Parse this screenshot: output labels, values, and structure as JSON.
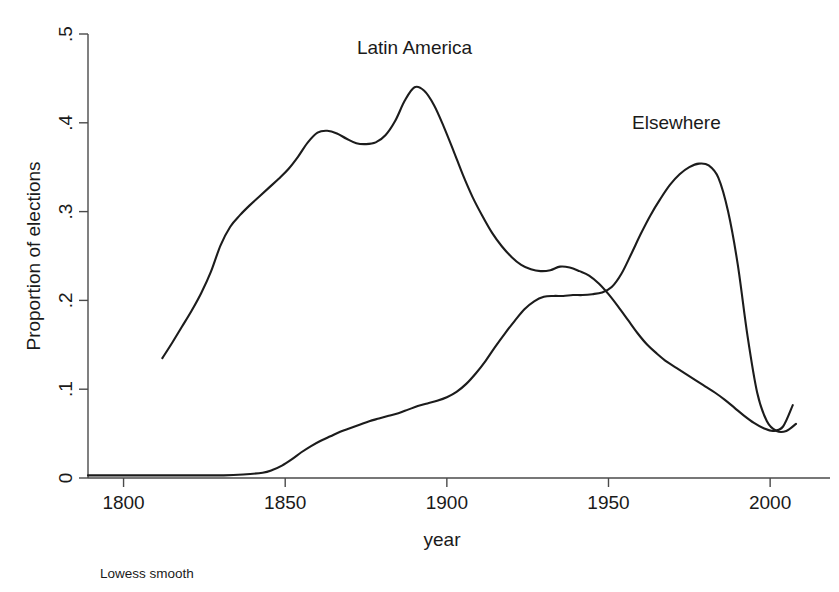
{
  "chart_data": {
    "type": "line",
    "title": "",
    "xlabel": "year",
    "ylabel": "Proportion of elections",
    "note": "Lowess smooth",
    "xlim": [
      1789,
      2008
    ],
    "ylim": [
      0,
      0.5
    ],
    "xticks": [
      1800,
      1850,
      1900,
      1950,
      2000
    ],
    "xtick_labels": [
      "1800",
      "1850",
      "1900",
      "1950",
      "2000"
    ],
    "yticks": [
      0,
      0.1,
      0.2,
      0.3,
      0.4,
      0.5
    ],
    "ytick_labels": [
      "0",
      ".1",
      ".2",
      ".3",
      ".4",
      ".5"
    ],
    "grid": false,
    "legend": "inline-annotations",
    "series": [
      {
        "name": "Latin America",
        "label_x": 1890,
        "label_y": 0.478,
        "color": "#1c1c1c",
        "x": [
          1812,
          1815,
          1818,
          1821,
          1824,
          1827,
          1830,
          1833,
          1836,
          1839,
          1842,
          1845,
          1848,
          1851,
          1854,
          1857,
          1860,
          1863,
          1866,
          1869,
          1872,
          1875,
          1878,
          1881,
          1884,
          1887,
          1890,
          1893,
          1896,
          1899,
          1902,
          1905,
          1908,
          1911,
          1914,
          1917,
          1920,
          1923,
          1926,
          1929,
          1932,
          1935,
          1938,
          1941,
          1944,
          1947,
          1950,
          1953,
          1956,
          1959,
          1962,
          1965,
          1968,
          1971,
          1974,
          1977,
          1980,
          1983,
          1986,
          1989,
          1992,
          1995,
          1998,
          2001,
          2004,
          2007
        ],
        "y": [
          0.135,
          0.152,
          0.17,
          0.188,
          0.208,
          0.232,
          0.262,
          0.283,
          0.296,
          0.307,
          0.317,
          0.327,
          0.337,
          0.348,
          0.362,
          0.378,
          0.389,
          0.391,
          0.388,
          0.382,
          0.377,
          0.376,
          0.378,
          0.386,
          0.402,
          0.425,
          0.44,
          0.436,
          0.42,
          0.396,
          0.369,
          0.341,
          0.316,
          0.295,
          0.276,
          0.261,
          0.249,
          0.24,
          0.235,
          0.233,
          0.234,
          0.238,
          0.237,
          0.233,
          0.228,
          0.219,
          0.207,
          0.193,
          0.178,
          0.163,
          0.15,
          0.14,
          0.131,
          0.124,
          0.117,
          0.11,
          0.103,
          0.096,
          0.088,
          0.079,
          0.07,
          0.062,
          0.056,
          0.053,
          0.058,
          0.082
        ]
      },
      {
        "name": "Elsewhere",
        "label_x": 1971,
        "label_y": 0.393,
        "color": "#1c1c1c",
        "x": [
          1789,
          1795,
          1801,
          1807,
          1813,
          1819,
          1825,
          1831,
          1837,
          1843,
          1846,
          1849,
          1852,
          1855,
          1858,
          1861,
          1864,
          1867,
          1870,
          1873,
          1876,
          1879,
          1882,
          1885,
          1888,
          1891,
          1894,
          1897,
          1900,
          1903,
          1906,
          1909,
          1912,
          1915,
          1918,
          1921,
          1924,
          1927,
          1930,
          1933,
          1936,
          1939,
          1942,
          1945,
          1948,
          1951,
          1954,
          1957,
          1960,
          1963,
          1966,
          1969,
          1972,
          1975,
          1978,
          1981,
          1984,
          1987,
          1990,
          1993,
          1996,
          1999,
          2002,
          2005,
          2008
        ],
        "y": [
          0.003,
          0.003,
          0.003,
          0.003,
          0.003,
          0.003,
          0.003,
          0.003,
          0.004,
          0.006,
          0.009,
          0.014,
          0.021,
          0.029,
          0.036,
          0.042,
          0.047,
          0.052,
          0.056,
          0.06,
          0.064,
          0.067,
          0.07,
          0.073,
          0.077,
          0.081,
          0.084,
          0.087,
          0.091,
          0.097,
          0.106,
          0.118,
          0.132,
          0.148,
          0.163,
          0.177,
          0.19,
          0.199,
          0.204,
          0.205,
          0.205,
          0.206,
          0.206,
          0.207,
          0.209,
          0.215,
          0.23,
          0.252,
          0.275,
          0.296,
          0.314,
          0.33,
          0.342,
          0.35,
          0.354,
          0.352,
          0.338,
          0.3,
          0.24,
          0.16,
          0.096,
          0.064,
          0.053,
          0.053,
          0.061
        ]
      }
    ]
  },
  "layout": {
    "plot_left": 88,
    "plot_right": 796,
    "plot_top": 34,
    "plot_bottom": 478
  }
}
